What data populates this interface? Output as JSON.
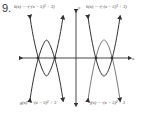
{
  "problem": {
    "number": "9."
  },
  "labels": {
    "top_left": "k(x) = -(-(x − 5)² + 3)",
    "top_right": "h(x) = -(-(x − 5)² + 3)",
    "bottom_left": "g(x) = -(x − 5)² + 3",
    "bottom_right": "f(x) = -(x − 5)² + 3"
  },
  "axes": {
    "x_label": "x",
    "y_label": "y"
  },
  "colors": {
    "curve_dark": "#333333",
    "curve_light": "#777777",
    "axis": "#333333"
  }
}
